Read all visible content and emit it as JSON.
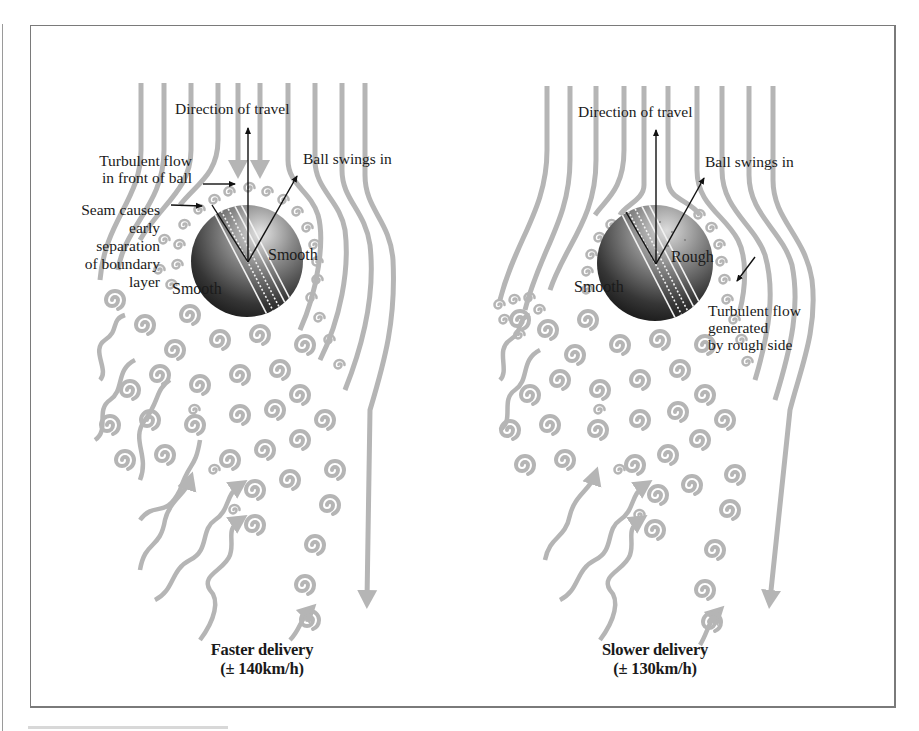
{
  "figure": {
    "colors": {
      "streamline": "#b5b5b5",
      "arrow": "#111111",
      "frame": "#7a7a7a",
      "background": "#ffffff",
      "ball_dark": "#1c1c1c",
      "ball_light": "#d8d8d8"
    },
    "panels": [
      {
        "id": "faster",
        "direction_label": "Direction of travel",
        "swing_label": "Ball swings in",
        "annotations": {
          "turbulent_front": [
            "Turbulent flow",
            "in front of ball"
          ],
          "seam": [
            "Seam causes",
            "early",
            "separation",
            "of boundary",
            "layer"
          ]
        },
        "ball_side_labels": {
          "right": "Smooth",
          "left": "Smooth"
        },
        "caption": {
          "title": "Faster delivery",
          "speed": "(± 140km/h)"
        }
      },
      {
        "id": "slower",
        "direction_label": "Direction of travel",
        "swing_label": "Ball swings in",
        "annotations": {
          "turbulent_rough": [
            "Turbulent flow",
            "generated",
            "by rough side"
          ]
        },
        "ball_side_labels": {
          "right": "Rough",
          "left": "Smooth"
        },
        "caption": {
          "title": "Slower delivery",
          "speed": "(± 130km/h)"
        }
      }
    ]
  }
}
